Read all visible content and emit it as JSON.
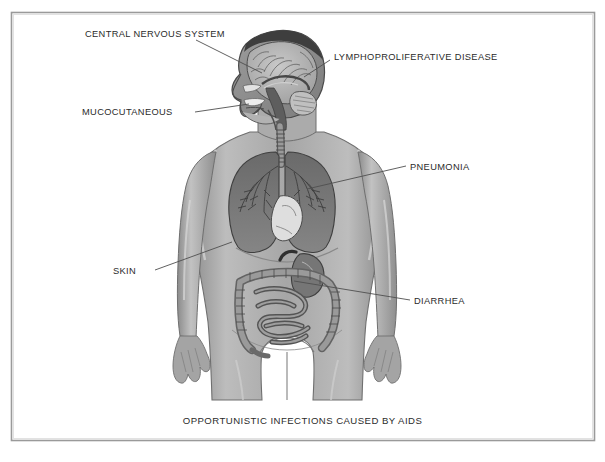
{
  "figure": {
    "caption": "OPPORTUNISTIC INFECTIONS CAUSED BY AIDS",
    "border_color": "#9a9a9a",
    "background_color": "#ffffff",
    "text_color": "#2b2b2b",
    "leader_line_color": "#555555",
    "body_fill": "#a8a8a8",
    "organ_dark": "#6d6d6d",
    "organ_mid": "#8a8a8a",
    "organ_light": "#d8d8d8"
  },
  "labels": [
    {
      "id": "central-nervous-system",
      "text": "CENTRAL NERVOUS SYSTEM",
      "x": 85,
      "y": 29
    },
    {
      "id": "lymphoproliferative-disease",
      "text": "LYMPHOPROLIFERATIVE DISEASE",
      "x": 334,
      "y": 52
    },
    {
      "id": "mucocutaneous",
      "text": "MUCOCUTANEOUS",
      "x": 82,
      "y": 107
    },
    {
      "id": "pneumonia",
      "text": "PNEUMONIA",
      "x": 410,
      "y": 162
    },
    {
      "id": "skin",
      "text": "SKIN",
      "x": 113,
      "y": 266
    },
    {
      "id": "diarrhea",
      "text": "DIARRHEA",
      "x": 414,
      "y": 296
    }
  ],
  "anatomy_parts": [
    "head-sagittal-section",
    "brain",
    "cerebellum",
    "brainstem",
    "nasal-cavity",
    "oral-cavity",
    "trachea",
    "neck",
    "left-lung",
    "right-lung",
    "bronchial-tree",
    "heart",
    "stomach",
    "large-intestine",
    "small-intestine",
    "torso",
    "left-arm",
    "right-arm",
    "left-hand",
    "right-hand",
    "left-thigh",
    "right-thigh"
  ]
}
